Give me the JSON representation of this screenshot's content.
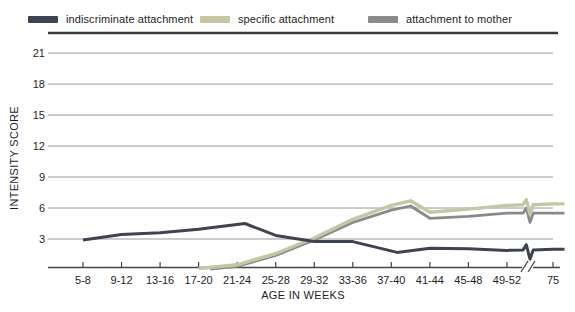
{
  "chart_data": {
    "type": "line",
    "title": "",
    "xlabel": "AGE IN WEEKS",
    "ylabel": "INTENSITY SCORE",
    "x_unit": "category_index_fractional",
    "x_axis": {
      "categories": [
        "5-8",
        "9-12",
        "13-16",
        "17-20",
        "21-24",
        "25-28",
        "29-32",
        "33-36",
        "37-40",
        "41-44",
        "45-48",
        "49-52",
        "75"
      ],
      "break_between": [
        "49-52",
        "75"
      ]
    },
    "y_axis": {
      "ticks": [
        3,
        6,
        9,
        12,
        15,
        18,
        21
      ],
      "range": [
        0,
        23
      ],
      "gridlines": true
    },
    "legend_position": "top",
    "line_break_marks": true,
    "colors": {
      "gridline": "#999999",
      "top_border": "#3a3a3a",
      "axis": "#444444",
      "text": "#1d1d1d"
    },
    "series": [
      {
        "name": "indiscriminate attachment",
        "color": "#3d4450",
        "points": [
          [
            0,
            2.9
          ],
          [
            1,
            3.45
          ],
          [
            2,
            3.6
          ],
          [
            3,
            3.95
          ],
          [
            4.2,
            4.5
          ],
          [
            5,
            3.35
          ],
          [
            6,
            2.75
          ],
          [
            7,
            2.75
          ],
          [
            8.15,
            1.7
          ],
          [
            9,
            2.1
          ],
          [
            10,
            2.05
          ],
          [
            11,
            1.9
          ],
          [
            12,
            2.0
          ]
        ]
      },
      {
        "name": "specific attachment",
        "color": "#c6c6a4",
        "points": [
          [
            3,
            0.15
          ],
          [
            4,
            0.5
          ],
          [
            5,
            1.6
          ],
          [
            6,
            3.1
          ],
          [
            7,
            4.9
          ],
          [
            8,
            6.25
          ],
          [
            8.5,
            6.7
          ],
          [
            9,
            5.6
          ],
          [
            10,
            5.9
          ],
          [
            11,
            6.25
          ],
          [
            12,
            6.4
          ]
        ]
      },
      {
        "name": "attachment to mother",
        "color": "#8a8a8a",
        "points": [
          [
            3.3,
            0.1
          ],
          [
            4,
            0.35
          ],
          [
            5,
            1.4
          ],
          [
            6,
            2.9
          ],
          [
            7,
            4.6
          ],
          [
            8,
            5.8
          ],
          [
            8.5,
            6.2
          ],
          [
            9,
            5.0
          ],
          [
            10,
            5.2
          ],
          [
            11,
            5.5
          ],
          [
            12,
            5.5
          ]
        ]
      }
    ]
  }
}
